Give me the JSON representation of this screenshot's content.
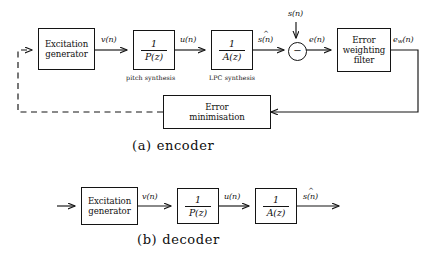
{
  "figure": {
    "encoder": {
      "caption_tag": "(a)",
      "caption_text": "encoder",
      "blocks": {
        "excitation_generator": {
          "line1": "Excitation",
          "line2": "generator"
        },
        "pitch_synthesis": {
          "numerator": "1",
          "denominator": "P(z)",
          "note": "pitch synthesis"
        },
        "lpc_synthesis": {
          "numerator": "1",
          "denominator": "A(z)",
          "note": "LPC synthesis"
        },
        "error_weighting_filter": {
          "line1": "Error",
          "line2": "weighting",
          "line3": "filter"
        },
        "error_minimisation": {
          "line1": "Error",
          "line2": "minimisation"
        },
        "summing_node": {
          "sign": "−"
        }
      },
      "signals": {
        "excitation_out": "v(n)",
        "pitch_out": "u(n)",
        "synth_speech": "s(n)",
        "input_speech": "s(n)",
        "error": "e(n)",
        "weighted_error_base": "e",
        "weighted_error_sub": "w",
        "weighted_error_tail": "(n)"
      }
    },
    "decoder": {
      "caption_tag": "(b)",
      "caption_text": "decoder",
      "blocks": {
        "excitation_generator": {
          "line1": "Excitation",
          "line2": "generator"
        },
        "pitch_synthesis": {
          "numerator": "1",
          "denominator": "P(z)"
        },
        "lpc_synthesis": {
          "numerator": "1",
          "denominator": "A(z)"
        }
      },
      "signals": {
        "excitation_out": "v(n)",
        "pitch_out": "u(n)",
        "synth_speech": "s(n)"
      }
    },
    "colors": {
      "ink": "#141414",
      "background": "#ffffff"
    }
  }
}
